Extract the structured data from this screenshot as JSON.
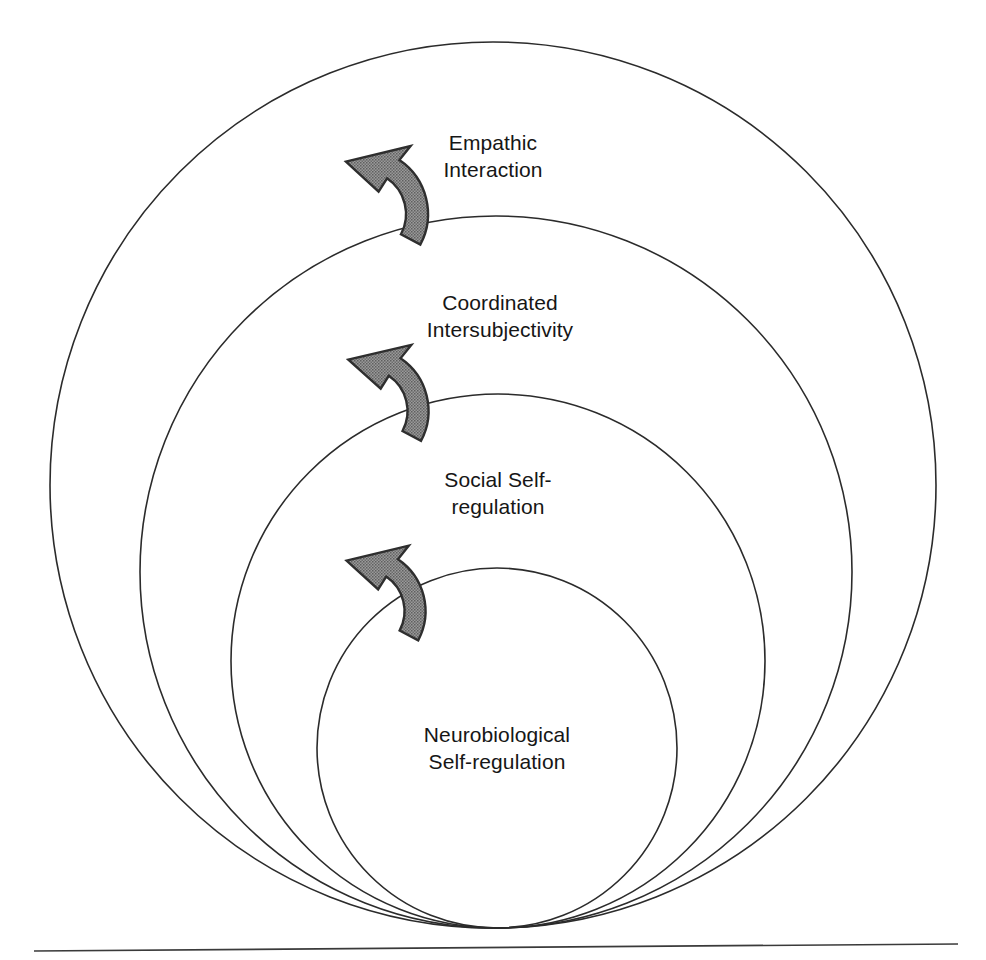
{
  "figure": {
    "type": "concentric-nested-circles",
    "background_color": "#ffffff",
    "line_color": "#2b2b2b",
    "text_color": "#161616",
    "arrow_fill_color": "#8a8a8a",
    "arrow_outline_color": "#2e2e2e",
    "baseline": {
      "name": "ground-baseline",
      "x1": 34,
      "y1": 951,
      "x2": 958,
      "y2": 944
    }
  },
  "rings": [
    {
      "id": "empathic-interaction",
      "label_line1": "Empathic",
      "label_line2": "Interaction",
      "order": 1,
      "cx": 493,
      "cy": 485,
      "r": 443,
      "label_x": 493,
      "label_y": 150
    },
    {
      "id": "coordinated-intersubjectivity",
      "label_line1": "Coordinated",
      "label_line2": "Intersubjectivity",
      "order": 2,
      "cx": 496,
      "cy": 572,
      "r": 356,
      "label_x": 500,
      "label_y": 310
    },
    {
      "id": "social-self-regulation",
      "label_line1": "Social Self-",
      "label_line2": "regulation",
      "order": 3,
      "cx": 498,
      "cy": 661,
      "r": 267,
      "label_x": 498,
      "label_y": 487
    },
    {
      "id": "neurobiological-self-regulation",
      "label_line1": "Neurobiological",
      "label_line2": "Self-regulation",
      "order": 4,
      "cx": 497,
      "cy": 748,
      "r": 180,
      "label_x": 497,
      "label_y": 742
    }
  ],
  "arrows": [
    {
      "id": "arrow-social-to-coordinated",
      "name": "cycle-arrow-lower",
      "direction": "counterclockwise-upward",
      "cx": 363,
      "cy": 611,
      "radius": 52,
      "thickness": 21
    },
    {
      "id": "arrow-coordinated-to-empathic",
      "name": "cycle-arrow-middle",
      "direction": "counterclockwise-upward",
      "cx": 365,
      "cy": 411,
      "radius": 53,
      "thickness": 21
    },
    {
      "id": "arrow-empathic-outer",
      "name": "cycle-arrow-upper",
      "direction": "counterclockwise-upward",
      "cx": 363,
      "cy": 214,
      "radius": 54,
      "thickness": 22
    }
  ]
}
